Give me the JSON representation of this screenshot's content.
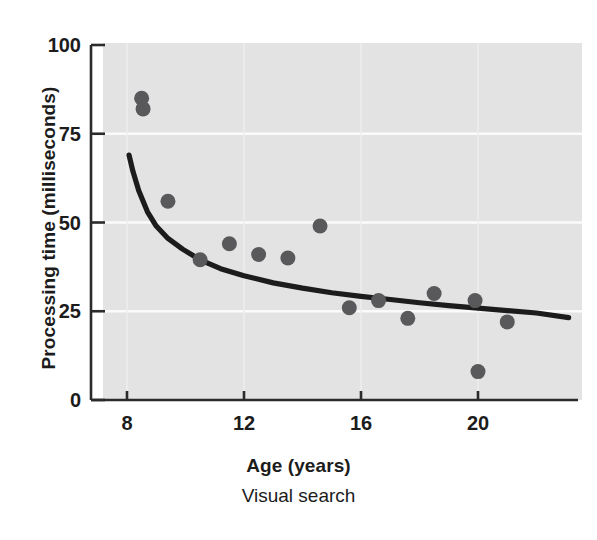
{
  "chart_data": {
    "type": "scatter",
    "title": "",
    "subtitle": "Visual search",
    "xlabel": "Age (years)",
    "ylabel": "Processing time (milliseconds)",
    "xlim": [
      7.2,
      23.3
    ],
    "ylim": [
      0,
      100
    ],
    "xticks": [
      8,
      12,
      16,
      20
    ],
    "xtick_labels": [
      "8",
      "12",
      "16",
      "20"
    ],
    "yticks": [
      0,
      25,
      50,
      75,
      100
    ],
    "ytick_labels": [
      "0",
      "25",
      "50",
      "75",
      "100"
    ],
    "grid": "horizontal-white",
    "legend": "none",
    "marker_color": "#59595b",
    "curve_color": "#1c1c1c",
    "plot_background": "#e3e3e3",
    "gridline_color": "#fbfbfb",
    "points": [
      {
        "x": 8.5,
        "y": 85
      },
      {
        "x": 8.55,
        "y": 82
      },
      {
        "x": 9.4,
        "y": 56
      },
      {
        "x": 10.5,
        "y": 39.5
      },
      {
        "x": 11.5,
        "y": 44
      },
      {
        "x": 12.5,
        "y": 41
      },
      {
        "x": 13.5,
        "y": 40
      },
      {
        "x": 14.6,
        "y": 49
      },
      {
        "x": 15.6,
        "y": 26
      },
      {
        "x": 16.6,
        "y": 28
      },
      {
        "x": 17.6,
        "y": 23
      },
      {
        "x": 18.5,
        "y": 30
      },
      {
        "x": 19.9,
        "y": 28
      },
      {
        "x": 20.0,
        "y": 8
      },
      {
        "x": 21.0,
        "y": 22
      }
    ],
    "fit_curve": {
      "label": "fitted decay curve",
      "x": [
        8.07,
        8.2,
        8.4,
        8.7,
        9.0,
        9.4,
        9.9,
        10.5,
        11.2,
        12.0,
        13.0,
        14.0,
        15.0,
        16.0,
        17.0,
        18.0,
        19.0,
        20.0,
        21.0,
        22.0,
        23.1
      ],
      "y": [
        69,
        64.5,
        59,
        53,
        49,
        45.5,
        42.5,
        39.5,
        37,
        35,
        33,
        31.5,
        30.2,
        29.2,
        28.3,
        27.4,
        26.6,
        25.9,
        25.2,
        24.5,
        23.2
      ]
    }
  },
  "geometry": {
    "note": "pixel mapping used by the renderer",
    "x_pixel_of_8": 127,
    "x_pixel_of_20": 478,
    "y_pixel_of_0": 400,
    "y_pixel_of_100": 45,
    "plot_left": 103,
    "plot_right": 582,
    "plot_top": 43,
    "plot_bottom": 400,
    "marker_radius": 7.5
  }
}
